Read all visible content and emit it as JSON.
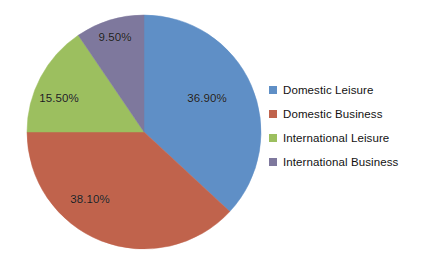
{
  "chart_data": {
    "type": "pie",
    "title": "",
    "xlabel": "",
    "ylabel": "",
    "grid": false,
    "legend_position": "right",
    "categories": [
      "Domestic Leisure",
      "Domestic Business",
      "International Leisure",
      "International Business"
    ],
    "values": [
      36.9,
      38.1,
      15.5,
      9.5
    ],
    "value_labels": [
      "36.90%",
      "38.10%",
      "15.50%",
      "9.50%"
    ],
    "colors": [
      "#5F8FC6",
      "#C0634C",
      "#9CBF5F",
      "#7E789D"
    ],
    "start_angle_deg": 0,
    "direction": "clockwise",
    "units": "percent",
    "total": 100.0
  },
  "pie": {
    "center_x": 144,
    "center_y": 132,
    "radius": 117,
    "labels": [
      {
        "text": "36.90%",
        "x": 207,
        "y": 98
      },
      {
        "text": "38.10%",
        "x": 90,
        "y": 199
      },
      {
        "text": "15.50%",
        "x": 59,
        "y": 98
      },
      {
        "text": "9.50%",
        "x": 115,
        "y": 37
      }
    ]
  },
  "legend": {
    "items": [
      {
        "label": "Domestic Leisure",
        "color": "#5F8FC6"
      },
      {
        "label": "Domestic Business",
        "color": "#C0634C"
      },
      {
        "label": "International Leisure",
        "color": "#9CBF5F"
      },
      {
        "label": "International Business",
        "color": "#7E789D"
      }
    ]
  }
}
